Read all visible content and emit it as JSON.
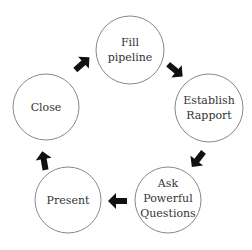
{
  "diagram": {
    "type": "cycle",
    "nodes": [
      {
        "id": "fill",
        "lines": [
          "Fill",
          "pipeline"
        ]
      },
      {
        "id": "establish",
        "lines": [
          "Establish",
          "Rapport"
        ]
      },
      {
        "id": "ask",
        "lines": [
          "Ask",
          "Powerful",
          "Questions"
        ]
      },
      {
        "id": "present",
        "lines": [
          "Present"
        ]
      },
      {
        "id": "close",
        "lines": [
          "Close"
        ]
      }
    ],
    "edges": [
      {
        "from": "fill",
        "to": "establish"
      },
      {
        "from": "establish",
        "to": "ask"
      },
      {
        "from": "ask",
        "to": "present"
      },
      {
        "from": "present",
        "to": "close"
      },
      {
        "from": "close",
        "to": "fill"
      }
    ],
    "colors": {
      "circle_stroke": "#888888",
      "arrow": "#111111",
      "text": "#333333"
    }
  }
}
